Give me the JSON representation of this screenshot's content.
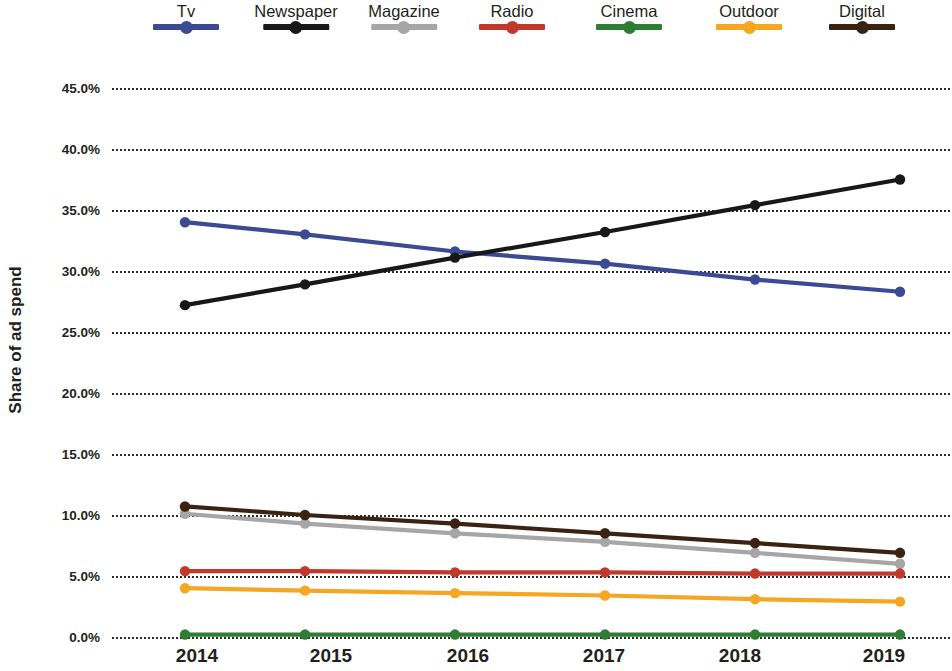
{
  "chart_data": {
    "type": "line",
    "title": "",
    "xlabel": "",
    "ylabel": "Share of ad spend",
    "categories": [
      "2014",
      "2015",
      "2016",
      "2017",
      "2018",
      "2019"
    ],
    "x": [
      2014,
      2015,
      2016,
      2017,
      2018,
      2019
    ],
    "ylim": [
      0.0,
      45.0
    ],
    "yticks": [
      "0.0%",
      "5.0%",
      "10.0%",
      "15.0%",
      "20.0%",
      "25.0%",
      "30.0%",
      "35.0%",
      "40.0%",
      "45.0%"
    ],
    "ytick_values": [
      0.0,
      5.0,
      10.0,
      15.0,
      20.0,
      25.0,
      30.0,
      35.0,
      40.0,
      45.0
    ],
    "grid": "horizontal-dotted",
    "legend_position": "top",
    "value_suffix": "%",
    "series": [
      {
        "name": "Tv",
        "color": "#3b4a93",
        "values": [
          34.0,
          33.0,
          31.6,
          30.6,
          29.3,
          28.3
        ]
      },
      {
        "name": "Newspaper",
        "color": "#181818",
        "values": [
          27.2,
          28.9,
          31.1,
          33.2,
          35.4,
          37.5
        ]
      },
      {
        "name": "Magazine",
        "color": "#a6a6a6",
        "values": [
          10.1,
          9.3,
          8.5,
          7.8,
          6.9,
          6.0
        ]
      },
      {
        "name": "Radio",
        "color": "#c0392b",
        "values": [
          5.4,
          5.4,
          5.3,
          5.3,
          5.2,
          5.2
        ]
      },
      {
        "name": "Cinema",
        "color": "#2e7d32",
        "values": [
          0.2,
          0.2,
          0.2,
          0.2,
          0.2,
          0.2
        ]
      },
      {
        "name": "Outdoor",
        "color": "#f5a623",
        "values": [
          4.0,
          3.8,
          3.6,
          3.4,
          3.1,
          2.9
        ]
      },
      {
        "name": "Digital",
        "color": "#3b2314",
        "values": [
          10.7,
          10.0,
          9.3,
          8.5,
          7.7,
          6.9
        ]
      }
    ]
  },
  "legend": {
    "items": [
      {
        "label": "Tv",
        "color": "#3b4a93",
        "x": 186
      },
      {
        "label": "Newspaper",
        "color": "#181818",
        "x": 296
      },
      {
        "label": "Magazine",
        "color": "#a6a6a6",
        "x": 404
      },
      {
        "label": "Radio",
        "color": "#c0392b",
        "x": 512
      },
      {
        "label": "Cinema",
        "color": "#2e7d32",
        "x": 629
      },
      {
        "label": "Outdoor",
        "color": "#f5a623",
        "x": 749
      },
      {
        "label": "Digital",
        "color": "#3b2314",
        "x": 862
      }
    ]
  },
  "axes": {
    "y_title": "Share of ad spend",
    "x_labels": [
      "2014",
      "2015",
      "2016",
      "2017",
      "2018",
      "2019"
    ],
    "x_label_positions": [
      197,
      331,
      468,
      604,
      740,
      884
    ]
  }
}
